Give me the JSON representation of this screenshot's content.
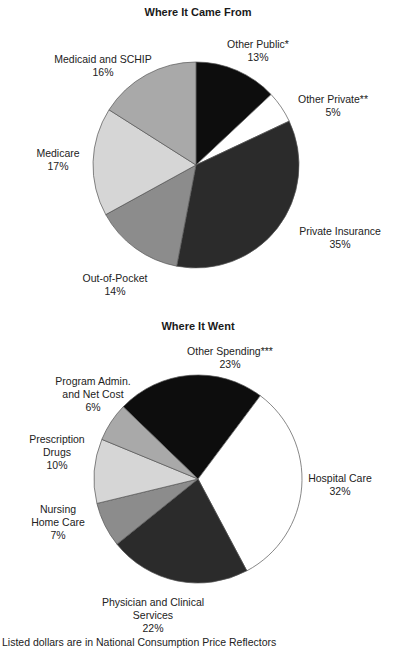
{
  "chart_data": [
    {
      "type": "pie",
      "title": "Where It Came From",
      "start_angle_deg": 0,
      "direction": "clockwise",
      "slices": [
        {
          "label": "Other Public*",
          "value": 13,
          "display": "13%",
          "color": "#0d0d0d"
        },
        {
          "label": "Other Private**",
          "value": 5,
          "display": "5%",
          "color": "#ffffff"
        },
        {
          "label": "Private Insurance",
          "value": 35,
          "display": "35%",
          "color": "#2b2b2b"
        },
        {
          "label": "Out-of-Pocket",
          "value": 14,
          "display": "14%",
          "color": "#8c8c8c"
        },
        {
          "label": "Medicare",
          "value": 17,
          "display": "17%",
          "color": "#d6d6d6"
        },
        {
          "label": "Medicaid and SCHIP",
          "value": 16,
          "display": "16%",
          "color": "#a9a9a9"
        }
      ]
    },
    {
      "type": "pie",
      "title": "Where It Went",
      "start_angle_deg": -46,
      "direction": "clockwise",
      "slices": [
        {
          "label": "Other Spending***",
          "value": 23,
          "display": "23%",
          "color": "#0d0d0d"
        },
        {
          "label": "Hospital Care",
          "value": 32,
          "display": "32%",
          "color": "#ffffff"
        },
        {
          "label": "Physician and Clinical Services",
          "value": 22,
          "display": "22%",
          "color": "#2b2b2b"
        },
        {
          "label": "Nursing Home Care",
          "value": 7,
          "display": "7%",
          "color": "#8c8c8c"
        },
        {
          "label": "Prescription Drugs",
          "value": 10,
          "display": "10%",
          "color": "#d6d6d6"
        },
        {
          "label": "Program Admin. and Net Cost",
          "value": 6,
          "display": "6%",
          "color": "#a9a9a9"
        }
      ]
    }
  ],
  "chart1": {
    "title": "Where It Came From",
    "labels": {
      "other_public": {
        "name": "Other Public*",
        "pct": "13%"
      },
      "other_private": {
        "name": "Other Private**",
        "pct": "5%"
      },
      "private_insurance": {
        "name": "Private Insurance",
        "pct": "35%"
      },
      "out_of_pocket": {
        "name": "Out-of-Pocket",
        "pct": "14%"
      },
      "medicare": {
        "name": "Medicare",
        "pct": "17%"
      },
      "medicaid": {
        "name": "Medicaid and SCHIP",
        "pct": "16%"
      }
    }
  },
  "chart2": {
    "title": "Where It Went",
    "labels": {
      "other_spending": {
        "name": "Other Spending***",
        "pct": "23%"
      },
      "hospital": {
        "name": "Hospital Care",
        "pct": "32%"
      },
      "physician": {
        "line1": "Physician and Clinical",
        "line2": "Services",
        "pct": "22%"
      },
      "nursing": {
        "line1": "Nursing",
        "line2": "Home Care",
        "pct": "7%"
      },
      "prescription": {
        "line1": "Prescription",
        "line2": "Drugs",
        "pct": "10%"
      },
      "program_admin": {
        "line1": "Program Admin.",
        "line2": "and Net Cost",
        "pct": "6%"
      }
    }
  },
  "footer_partial_text": "Listed dollars are in National Consumption Price Reflectors"
}
